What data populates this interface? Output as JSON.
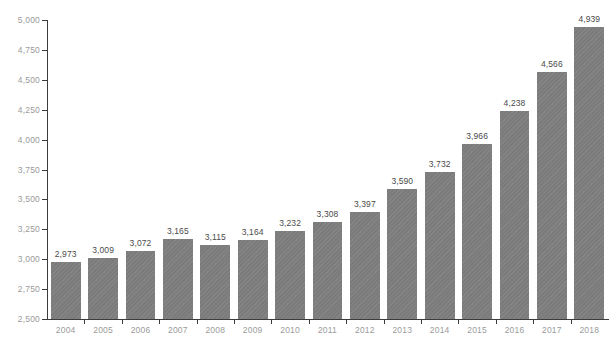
{
  "chart_data": {
    "type": "bar",
    "title": "",
    "subtitle": "",
    "xlabel": "",
    "ylabel": "",
    "categories": [
      "2004",
      "2005",
      "2006",
      "2007",
      "2008",
      "2009",
      "2010",
      "2011",
      "2012",
      "2013",
      "2014",
      "2015",
      "2016",
      "2017",
      "2018"
    ],
    "values": [
      2973,
      3009,
      3072,
      3165,
      3115,
      3164,
      3232,
      3308,
      3397,
      3590,
      3732,
      3966,
      4238,
      4566,
      4939
    ],
    "value_labels": [
      "2,973",
      "3,009",
      "3,072",
      "3,165",
      "3,115",
      "3,164",
      "3,232",
      "3,308",
      "3,397",
      "3,590",
      "3,732",
      "3,966",
      "4,238",
      "4,566",
      "4,939"
    ],
    "ylim": [
      2500,
      5000
    ],
    "ytick_values": [
      2500,
      2750,
      3000,
      3250,
      3500,
      3750,
      4000,
      4250,
      4500,
      4750,
      5000
    ],
    "ytick_labels": [
      "2,500",
      "2,750",
      "3,000",
      "3,250",
      "3,500",
      "3,750",
      "4,000",
      "4,250",
      "4,500",
      "4,750",
      "5,000"
    ],
    "grid": false,
    "legend": false,
    "legend_position": "none",
    "bar_color": "#808080",
    "axis_color": "#3c3c3c",
    "tick_label_color": "#9b9b9b",
    "value_label_color": "#4a4a4a",
    "background_color": "#ffffff"
  }
}
